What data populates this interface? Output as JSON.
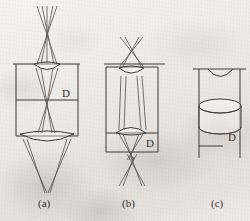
{
  "figure": {
    "background_color": "#edebe6",
    "ink_color": "#3b3a38",
    "ray_color": "#55534e",
    "panels": [
      {
        "id": "a",
        "caption": "(a)",
        "dimension_label": "D",
        "description": "Two-element lens in a two-section housing with crossing rays above and converging rays below",
        "elements": [
          "upper-biconvex-lens",
          "lower-biconvex-lens",
          "housing-outline",
          "mid-divider-line",
          "crossing-rays-top",
          "converging-rays-bottom"
        ]
      },
      {
        "id": "b",
        "caption": "(b)",
        "dimension_label": "D",
        "description": "Tall housing with an upper lens and a lower lens, collimated rays between them, crossing rays above and below",
        "elements": [
          "upper-biconvex-lens",
          "lower-biconvex-lens",
          "housing-outline",
          "lower-divider-line",
          "crossing-rays-top",
          "collimated-rays-middle",
          "crossing-rays-bottom"
        ]
      },
      {
        "id": "c",
        "caption": "(c)",
        "dimension_label": "D",
        "description": "Housing with a concave top surface and a cylindrical element shown in perspective",
        "elements": [
          "concave-top-surface",
          "cylinder-element",
          "housing-rails",
          "lower-shelf-line"
        ]
      }
    ],
    "captions": [
      "(a)",
      "(b)",
      "(c)"
    ],
    "dimension_labels": [
      "D",
      "D",
      "D"
    ]
  }
}
